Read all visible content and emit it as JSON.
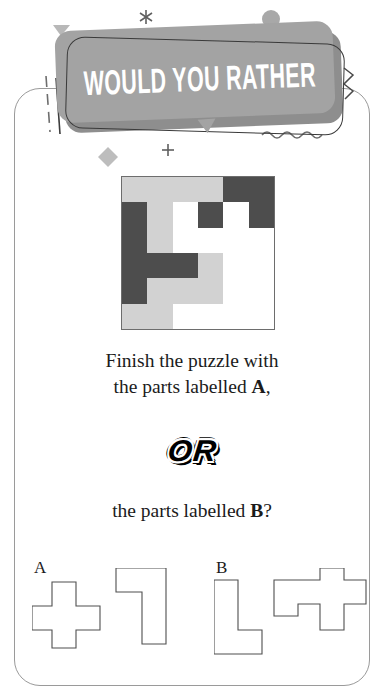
{
  "header": {
    "title": "WOULD YOU RATHER",
    "banner_color": "#a3a3a3",
    "banner_shadow_color": "#8e8e8e",
    "title_color": "#ffffff"
  },
  "puzzle": {
    "rows": 6,
    "cols": 6,
    "light_color": "#d2d2d2",
    "dark_color": "#4d4d4d",
    "empty_color": "#ffffff",
    "cells": [
      [
        "light",
        "light",
        "light",
        "light",
        "dark",
        "dark"
      ],
      [
        "dark",
        "light",
        "white",
        "dark",
        "white",
        "dark"
      ],
      [
        "dark",
        "light",
        "white",
        "white",
        "white",
        "white"
      ],
      [
        "dark",
        "dark",
        "dark",
        "light",
        "white",
        "white"
      ],
      [
        "dark",
        "light",
        "light",
        "light",
        "white",
        "white"
      ],
      [
        "light",
        "light",
        "white",
        "white",
        "white",
        "white"
      ]
    ]
  },
  "question": {
    "line1": "Finish the puzzle with",
    "line2_prefix": "the parts labelled ",
    "line2_bold": "A",
    "line2_suffix": ",",
    "or_label": "OR",
    "line3_prefix": "the parts labelled ",
    "line3_bold": "B",
    "line3_suffix": "?"
  },
  "options": [
    {
      "label": "A",
      "pieces": [
        {
          "name": "plus-cross-piece",
          "path": "M 20 14 L 44 14 L 44 38 L 68 38 L 68 62 L 44 62 L 44 80 L 20 80 L 20 62 L 0 62 L 0 38 L 20 38 Z"
        },
        {
          "name": "angular-l-piece",
          "path": "M 84 0 L 134 0 L 134 76 L 110 76 L 110 24 L 84 24 Z"
        }
      ]
    },
    {
      "label": "B",
      "pieces": [
        {
          "name": "corner-l-piece",
          "path": "M 0 12 L 24 12 L 24 62 L 48 62 L 48 86 L 0 86 Z"
        },
        {
          "name": "cross-piece",
          "path": "M 60 12 L 106 12 L 106 0 L 130 0 L 130 12 L 152 12 L 152 36 L 130 36 L 130 62 L 106 62 L 106 36 L 84 36 L 84 48 L 60 48 Z"
        }
      ]
    }
  ],
  "decorations": {
    "asterisk": "*",
    "plus": "+",
    "circle_color": "#a8a8a8",
    "diamond_color": "#bdbdbd",
    "triangle_color": "#b8b8b8",
    "line_color": "#6e6e6e"
  }
}
